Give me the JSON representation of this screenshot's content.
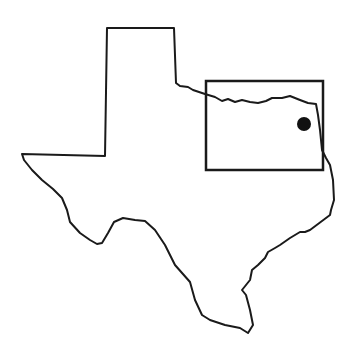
{
  "map": {
    "subject": "Texas state outline",
    "colors": {
      "background": "#ffffff",
      "stroke": "#1a1a1a",
      "marker": "#111111"
    },
    "outline_points": "107,28 174,28 176,83 180,86 188,87 193,90 205,94 215,97 222,101 228,99 235,102 242,100 250,102 258,103 266,101 272,98 282,98 290,96 300,100 308,103 316,104 318,115 320,130 322,150 326,158 330,165 333,180 334,200 331,210 330,215 318,224 310,230 305,232 300,232 290,238 280,245 275,248 268,252 265,258 258,265 252,270 250,280 242,290 246,295 250,310 253,325 248,333 240,328 225,325 210,320 202,315 195,300 190,282 175,265 165,245 155,230 145,221 135,220 123,218 114,222 108,233 102,243 97,244 90,240 80,233 70,222 67,210 62,198 53,189 42,180 32,170 24,160 22,154 105,156 107,28",
    "highlight_box": {
      "x": 206,
      "y": 81,
      "width": 117,
      "height": 89
    },
    "marker": {
      "cx": 304,
      "cy": 124,
      "r": 7
    }
  }
}
